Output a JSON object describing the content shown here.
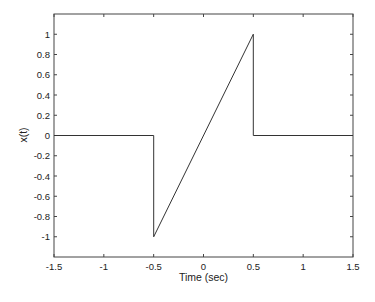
{
  "chart_data": {
    "type": "line",
    "title": "",
    "xlabel": "Time (sec)",
    "ylabel": "x(t)",
    "xlim": [
      -1.5,
      1.5
    ],
    "ylim": [
      -1.2,
      1.2
    ],
    "grid": false,
    "legend": null,
    "xticks": [
      -1.5,
      -1,
      -0.5,
      0,
      0.5,
      1,
      1.5
    ],
    "xtick_labels": [
      "-1.5",
      "-1",
      "-0.5",
      "0",
      "0.5",
      "1",
      "1.5"
    ],
    "yticks": [
      1,
      0.8,
      0.6,
      0.4,
      0.2,
      0,
      -0.2,
      -0.4,
      -0.6,
      -0.8,
      -1
    ],
    "ytick_labels": [
      "1",
      "0.8",
      "0.6",
      "0.4",
      "0.2",
      "0",
      "-0.2",
      "-0.4",
      "-0.6",
      "-0.8",
      "-1"
    ],
    "series": [
      {
        "name": "x(t)",
        "color": "#333333",
        "x": [
          -1.5,
          -0.5,
          -0.5,
          0.5,
          0.5,
          1.5
        ],
        "y": [
          0,
          0,
          -1,
          1,
          0,
          0
        ]
      }
    ]
  }
}
